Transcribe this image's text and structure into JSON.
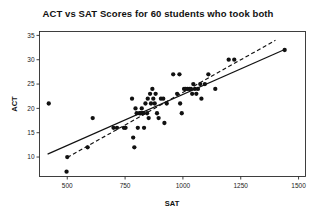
{
  "chart_data": {
    "type": "scatter",
    "title": "ACT vs SAT Scores for 60 students who took both",
    "xlabel": "SAT",
    "ylabel": "ACT",
    "xlim": [
      380,
      1530
    ],
    "ylim": [
      6,
      35.8
    ],
    "xticks": [
      500,
      750,
      1000,
      1250,
      1500
    ],
    "yticks": [
      10,
      15,
      20,
      25,
      30,
      35
    ],
    "grid": false,
    "legend": "none",
    "n_points": 60,
    "points": [
      {
        "x": 420,
        "y": 21
      },
      {
        "x": 497,
        "y": 7
      },
      {
        "x": 500,
        "y": 10
      },
      {
        "x": 588,
        "y": 12
      },
      {
        "x": 610,
        "y": 18
      },
      {
        "x": 700,
        "y": 16
      },
      {
        "x": 715,
        "y": 16
      },
      {
        "x": 745,
        "y": 16
      },
      {
        "x": 752,
        "y": 16
      },
      {
        "x": 780,
        "y": 22
      },
      {
        "x": 785,
        "y": 14
      },
      {
        "x": 790,
        "y": 12
      },
      {
        "x": 795,
        "y": 20
      },
      {
        "x": 800,
        "y": 19
      },
      {
        "x": 805,
        "y": 16
      },
      {
        "x": 812,
        "y": 19
      },
      {
        "x": 818,
        "y": 19
      },
      {
        "x": 822,
        "y": 20
      },
      {
        "x": 825,
        "y": 19
      },
      {
        "x": 828,
        "y": 19
      },
      {
        "x": 832,
        "y": 16
      },
      {
        "x": 838,
        "y": 21
      },
      {
        "x": 845,
        "y": 19
      },
      {
        "x": 848,
        "y": 22
      },
      {
        "x": 852,
        "y": 18
      },
      {
        "x": 858,
        "y": 23
      },
      {
        "x": 862,
        "y": 21
      },
      {
        "x": 868,
        "y": 24
      },
      {
        "x": 872,
        "y": 22
      },
      {
        "x": 878,
        "y": 21
      },
      {
        "x": 882,
        "y": 23
      },
      {
        "x": 888,
        "y": 19
      },
      {
        "x": 895,
        "y": 18
      },
      {
        "x": 905,
        "y": 22
      },
      {
        "x": 915,
        "y": 22
      },
      {
        "x": 920,
        "y": 17
      },
      {
        "x": 930,
        "y": 21
      },
      {
        "x": 958,
        "y": 27
      },
      {
        "x": 985,
        "y": 27
      },
      {
        "x": 975,
        "y": 23
      },
      {
        "x": 988,
        "y": 21
      },
      {
        "x": 995,
        "y": 19
      },
      {
        "x": 1005,
        "y": 24
      },
      {
        "x": 1012,
        "y": 24
      },
      {
        "x": 1020,
        "y": 24
      },
      {
        "x": 1028,
        "y": 24
      },
      {
        "x": 1035,
        "y": 24
      },
      {
        "x": 1040,
        "y": 23
      },
      {
        "x": 1045,
        "y": 25
      },
      {
        "x": 1052,
        "y": 24
      },
      {
        "x": 1058,
        "y": 23
      },
      {
        "x": 1065,
        "y": 24
      },
      {
        "x": 1075,
        "y": 25
      },
      {
        "x": 1080,
        "y": 22
      },
      {
        "x": 1095,
        "y": 25
      },
      {
        "x": 1110,
        "y": 27
      },
      {
        "x": 1140,
        "y": 24
      },
      {
        "x": 1198,
        "y": 30
      },
      {
        "x": 1222,
        "y": 30
      },
      {
        "x": 1440,
        "y": 32
      }
    ],
    "fit_lines": [
      {
        "name": "regression-line-solid",
        "style": "solid",
        "x0": 415,
        "y0": 10.6,
        "x1": 1440,
        "y1": 32.1
      },
      {
        "name": "reference-line-dashed",
        "style": "dashed",
        "x0": 500,
        "y0": 9.9,
        "x1": 1400,
        "y1": 34.0
      }
    ]
  }
}
